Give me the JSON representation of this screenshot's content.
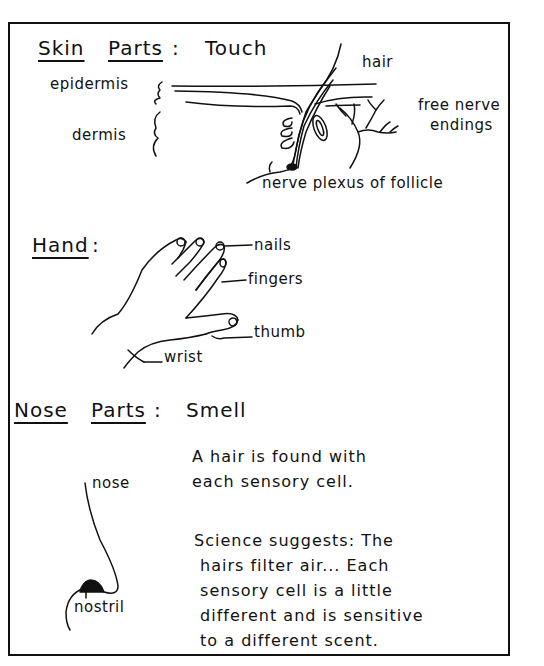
{
  "skin_section": {
    "heading_word1": "Skin",
    "heading_word2": "Parts",
    "heading_colon": ":",
    "heading_sense": "Touch",
    "labels": {
      "hair": "hair",
      "epidermis": "epidermis",
      "dermis": "dermis",
      "free_nerve_line1": "free nerve",
      "free_nerve_line2": "endings",
      "nerve_plexus": "nerve plexus of follicle"
    }
  },
  "hand_section": {
    "heading": "Hand",
    "heading_colon": ":",
    "labels": {
      "nails": "nails",
      "fingers": "fingers",
      "thumb": "thumb",
      "wrist": "wrist"
    }
  },
  "nose_section": {
    "heading_word1": "Nose",
    "heading_word2": "Parts",
    "heading_colon": ":",
    "heading_sense": "Smell",
    "labels": {
      "nose": "nose",
      "nostril": "nostril"
    },
    "paragraph1": "A hair is found with\neach sensory cell.",
    "paragraph2": "Science suggests: The\n hairs filter air... Each\n sensory cell is a little\n different and is sensitive\n to a different scent."
  }
}
